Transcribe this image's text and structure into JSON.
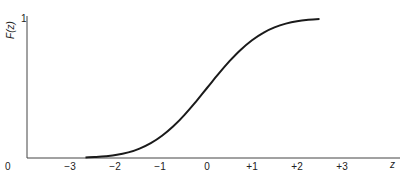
{
  "chart_data": {
    "type": "line",
    "title": "",
    "xlabel": "z",
    "ylabel": "F(z)",
    "xlim": [
      -4.4,
      4.1
    ],
    "ylim": [
      0,
      1
    ],
    "origin_label": "0",
    "y_top_tick_label": "1",
    "x_ticks": [
      {
        "value": -3,
        "label": "−3"
      },
      {
        "value": -2,
        "label": "−2"
      },
      {
        "value": -1,
        "label": "−1"
      },
      {
        "value": 0,
        "label": "0"
      },
      {
        "value": 1,
        "label": "+1"
      },
      {
        "value": 2,
        "label": "+2"
      },
      {
        "value": 3,
        "label": "+3"
      }
    ],
    "grid": false,
    "series": [
      {
        "name": "F(z)",
        "color": "#1a1a1a",
        "x": [
          -2.7,
          -2.5,
          -2.25,
          -2.0,
          -1.75,
          -1.5,
          -1.25,
          -1.0,
          -0.75,
          -0.5,
          -0.25,
          0.0,
          0.25,
          0.5,
          0.75,
          1.0,
          1.25,
          1.5,
          1.75,
          2.0,
          2.25,
          2.5
        ],
        "y": [
          0.0035,
          0.0062,
          0.0122,
          0.0228,
          0.0401,
          0.0668,
          0.1056,
          0.1587,
          0.2266,
          0.3085,
          0.4013,
          0.5,
          0.5987,
          0.6915,
          0.7734,
          0.8413,
          0.8944,
          0.9332,
          0.9599,
          0.9772,
          0.9878,
          0.9938
        ]
      }
    ]
  }
}
